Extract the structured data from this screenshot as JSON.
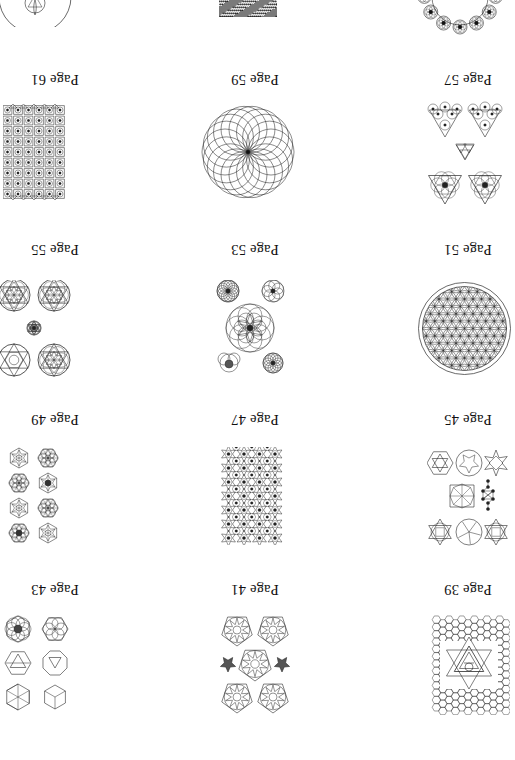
{
  "document": {
    "orientation": "rotated-180",
    "pages": [
      {
        "label": "Page 39",
        "art": "hexagon-grid-with-merkaba-triangle"
      },
      {
        "label": "Page 41",
        "art": "pentagon-mandalas-and-stars"
      },
      {
        "label": "Page 43",
        "art": "hexagonal-polyhedra-projections"
      },
      {
        "label": "Page 45",
        "art": "star-tetrahedra-and-tree-of-life"
      },
      {
        "label": "Page 47",
        "art": "star-tessellation-pattern"
      },
      {
        "label": "Page 49",
        "art": "metatron-cube-variations"
      },
      {
        "label": "Page 51",
        "art": "flower-of-life"
      },
      {
        "label": "Page 53",
        "art": "seed-of-life-rosettes"
      },
      {
        "label": "Page 55",
        "art": "circled-star-tetrahedra"
      },
      {
        "label": "Page 57",
        "art": "triangle-grid-figures"
      },
      {
        "label": "Page 59",
        "art": "torus-circle-rosette"
      },
      {
        "label": "Page 61",
        "art": "interlocking-lattice-pattern"
      }
    ],
    "partial_top": [
      {
        "art": "ring-of-rosettes"
      },
      {
        "art": "dense-noise-block"
      },
      {
        "art": "arched-circle-figure"
      }
    ]
  }
}
